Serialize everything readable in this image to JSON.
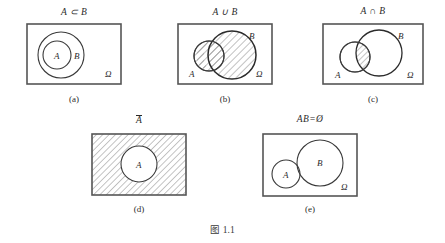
{
  "figure": {
    "caption": "图 1.1",
    "universe_symbol": "Ω",
    "colors": {
      "stroke": "#3a3a3a",
      "box_stroke": "#555555",
      "hatch": "#6b6b6b",
      "text": "#2b2b2b",
      "background": "#ffffff"
    },
    "panels": [
      {
        "id": "a",
        "title": "A ⊂ B",
        "caption": "(a)",
        "labels": {
          "inner": "A",
          "outer": "B",
          "universe": "Ω"
        },
        "description": "A is a subset of B; circle A nested inside circle B inside the sample space rectangle",
        "shaded": false
      },
      {
        "id": "b",
        "title": "A ∪ B",
        "caption": "(b)",
        "labels": {
          "left": "A",
          "right": "B",
          "universe": "Ω"
        },
        "description": "Union of A and B; both overlapping circles fully hatched",
        "shaded": true
      },
      {
        "id": "c",
        "title": "A ∩ B",
        "caption": "(c)",
        "labels": {
          "left": "A",
          "right": "B",
          "universe": "Ω"
        },
        "description": "Intersection of A and B; only the lens-shaped overlap is hatched",
        "shaded": true
      },
      {
        "id": "d",
        "title": "A",
        "title_overbar": true,
        "caption": "(d)",
        "labels": {
          "inner": "A"
        },
        "description": "Complement of A; rectangle hatched everywhere except inside circle A",
        "shaded": true
      },
      {
        "id": "e",
        "title": "AB=Ø",
        "caption": "(e)",
        "labels": {
          "left": "A",
          "right": "B",
          "universe": "Ω"
        },
        "description": "A and B are mutually exclusive; two disjoint circles inside the rectangle",
        "shaded": false
      }
    ]
  }
}
